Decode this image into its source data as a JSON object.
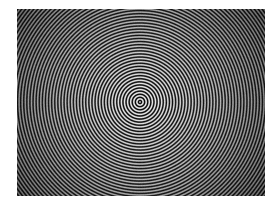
{
  "figure": {
    "title": "Concentric Ring Interference Pattern",
    "kind": "zone-plate",
    "alt_text": "Grayscale concentric ring pattern with bright high-contrast rings at the center fading to dark moire textured corners"
  },
  "canvas": {
    "width": 278,
    "height": 208,
    "background_color": "#ffffff"
  },
  "panel": {
    "x": 17,
    "y": 9,
    "width": 248,
    "height": 187,
    "background_color": "#0a0a0a",
    "border_color": "#f2f2f2"
  },
  "pattern": {
    "center_x": 140,
    "center_y": 102,
    "ring_period_px": 3.1,
    "ring_count": 78,
    "waveform": "sinusoidal",
    "bright_color": "#f0f0f0",
    "dark_color": "#050505",
    "mid_color": "#808080",
    "contrast_center": 1.0,
    "contrast_edge": 0.42,
    "vignette_strength": 0.55,
    "noise_amount": 0.05,
    "moire_corners": true
  },
  "chart_data": {
    "type": "heatmap",
    "title": "Concentric Ring Interference Pattern",
    "xlabel": "",
    "ylabel": "",
    "colormap": "gray",
    "colormap_min": "#050505",
    "colormap_max": "#f0f0f0",
    "function": "I(r) = env(r) * 0.5 * (1 + cos(2*pi*r / period))",
    "center": [
      140,
      102
    ],
    "period_px": 3.1,
    "radial_profile_r_px": [
      0,
      3,
      6,
      9,
      12,
      18,
      24,
      30,
      40,
      50,
      60,
      75,
      90,
      110,
      130,
      150
    ],
    "radial_profile_envelope": [
      1.0,
      0.99,
      0.98,
      0.97,
      0.96,
      0.93,
      0.9,
      0.87,
      0.82,
      0.77,
      0.72,
      0.64,
      0.57,
      0.5,
      0.45,
      0.42
    ],
    "radial_profile_mean_level": [
      0.5,
      0.5,
      0.5,
      0.5,
      0.5,
      0.49,
      0.48,
      0.47,
      0.45,
      0.44,
      0.42,
      0.38,
      0.34,
      0.29,
      0.25,
      0.22
    ],
    "grid": false,
    "legend": "none",
    "axis_visible": false,
    "xlim": [
      0,
      248
    ],
    "ylim": [
      0,
      187
    ]
  }
}
